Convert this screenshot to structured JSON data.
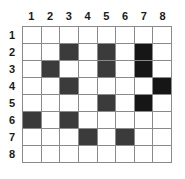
{
  "figure": {
    "name": "grid-puzzle",
    "type": "8x8-shaded-grid",
    "background_color": "#ffffff",
    "grid_line_color": "#8a8a8d",
    "border_color": "#59595b",
    "fill_color": "#3b3b3b",
    "fill_color_dark": "#161616"
  },
  "column_headers": [
    "1",
    "2",
    "3",
    "4",
    "5",
    "6",
    "7",
    "8"
  ],
  "row_headers": [
    "1",
    "2",
    "3",
    "4",
    "5",
    "6",
    "7",
    "8"
  ],
  "grid_data": {
    "rows": 8,
    "cols": 8,
    "filled_cells": [
      {
        "row": 2,
        "cols": [
          3,
          5,
          7
        ]
      },
      {
        "row": 3,
        "cols": [
          2,
          5,
          7
        ]
      },
      {
        "row": 4,
        "cols": [
          3,
          8
        ]
      },
      {
        "row": 5,
        "cols": [
          5,
          7
        ]
      },
      {
        "row": 6,
        "cols": [
          1,
          3
        ]
      },
      {
        "row": 7,
        "cols": [
          4,
          6
        ]
      }
    ],
    "dark_cells": [
      {
        "row": 2,
        "col": 7
      },
      {
        "row": 3,
        "col": 7
      },
      {
        "row": 4,
        "col": 8
      },
      {
        "row": 5,
        "col": 7
      }
    ],
    "matrix": [
      [
        0,
        0,
        0,
        0,
        0,
        0,
        0,
        0
      ],
      [
        0,
        0,
        1,
        0,
        1,
        0,
        2,
        0
      ],
      [
        0,
        1,
        0,
        0,
        1,
        0,
        2,
        0
      ],
      [
        0,
        0,
        1,
        0,
        0,
        0,
        0,
        2
      ],
      [
        0,
        0,
        0,
        0,
        1,
        0,
        2,
        0
      ],
      [
        1,
        0,
        1,
        0,
        0,
        0,
        0,
        0
      ],
      [
        0,
        0,
        0,
        1,
        0,
        1,
        0,
        0
      ],
      [
        0,
        0,
        0,
        0,
        0,
        0,
        0,
        0
      ]
    ]
  }
}
